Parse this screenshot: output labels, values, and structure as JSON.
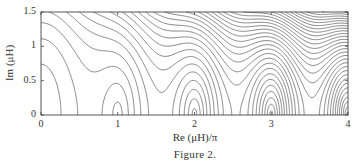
{
  "chart_data": {
    "type": "contour",
    "title": "",
    "caption": "Figure 2.",
    "xlabel": "Re (μH)/π",
    "ylabel": "Im (μH)",
    "xlim": [
      0,
      4
    ],
    "ylim": [
      0,
      1.5
    ],
    "x_ticks": [
      {
        "value": 0,
        "label": "0"
      },
      {
        "value": 1,
        "label": "1"
      },
      {
        "value": 2,
        "label": "2"
      },
      {
        "value": 3,
        "label": "3"
      },
      {
        "value": 4,
        "label": "4"
      }
    ],
    "y_ticks": [
      {
        "value": 0,
        "label": "0"
      },
      {
        "value": 0.5,
        "label": "0.5"
      },
      {
        "value": 1,
        "label": "1"
      },
      {
        "value": 1.5,
        "label": "1.5"
      }
    ],
    "grid": false,
    "legend": null,
    "minima_x": [
      0,
      1,
      2,
      3,
      4
    ],
    "function_model": "|μH| * |sin(μH)|",
    "levels": {
      "start": 0.6,
      "step": 0.9,
      "count": 34
    },
    "line_color": "#555555"
  },
  "figure": {
    "caption": "Figure 2."
  }
}
